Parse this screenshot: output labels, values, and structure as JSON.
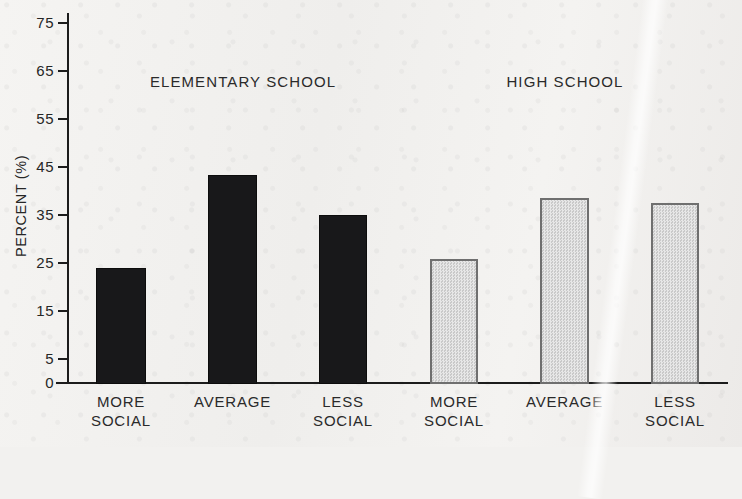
{
  "chart_data": {
    "type": "bar",
    "title": "",
    "xlabel": "",
    "ylabel": "PERCENT (%)",
    "ylim": [
      0,
      75
    ],
    "yticks": [
      0,
      5,
      15,
      25,
      35,
      45,
      55,
      65,
      75
    ],
    "ytick_labels": [
      "0",
      "5",
      "15",
      "25",
      "35",
      "45",
      "55",
      "65",
      "75"
    ],
    "grid": false,
    "legend_position": "none",
    "categories": [
      "MORE SOCIAL",
      "AVERAGE",
      "LESS SOCIAL"
    ],
    "groups": [
      {
        "name": "ELEMENTARY SCHOOL",
        "style": "solid-black",
        "color": "#18181a"
      },
      {
        "name": "HIGH SCHOOL",
        "style": "light-gray-halftone",
        "color": "#c9c9c9"
      }
    ],
    "series": [
      {
        "name": "ELEMENTARY SCHOOL",
        "values": [
          24.2,
          43.5,
          35.2
        ]
      },
      {
        "name": "HIGH SCHOOL",
        "values": [
          26.0,
          38.8,
          37.8
        ]
      }
    ],
    "bars": [
      {
        "group": "ELEMENTARY SCHOOL",
        "category": "MORE SOCIAL",
        "value": 24.2,
        "style": "dark"
      },
      {
        "group": "ELEMENTARY SCHOOL",
        "category": "AVERAGE",
        "value": 43.5,
        "style": "dark"
      },
      {
        "group": "ELEMENTARY SCHOOL",
        "category": "LESS SOCIAL",
        "value": 35.2,
        "style": "dark"
      },
      {
        "group": "HIGH SCHOOL",
        "category": "MORE SOCIAL",
        "value": 26.0,
        "style": "light"
      },
      {
        "group": "HIGH SCHOOL",
        "category": "AVERAGE",
        "value": 38.8,
        "style": "light"
      },
      {
        "group": "HIGH SCHOOL",
        "category": "LESS SOCIAL",
        "value": 37.8,
        "style": "light"
      }
    ]
  },
  "group_labels": [
    {
      "text": "ELEMENTARY SCHOOL"
    },
    {
      "text": "HIGH SCHOOL"
    }
  ],
  "category_labels": [
    {
      "line1": "MORE",
      "line2": "SOCIAL"
    },
    {
      "line1": "AVERAGE",
      "line2": ""
    },
    {
      "line1": "LESS",
      "line2": "SOCIAL"
    },
    {
      "line1": "MORE",
      "line2": "SOCIAL"
    },
    {
      "line1": "AVERAGE",
      "line2": ""
    },
    {
      "line1": "LESS",
      "line2": "SOCIAL"
    }
  ],
  "axis": {
    "y_title": "PERCENT (%)"
  },
  "bleed_through": {
    "line1": "",
    "line2": ""
  }
}
